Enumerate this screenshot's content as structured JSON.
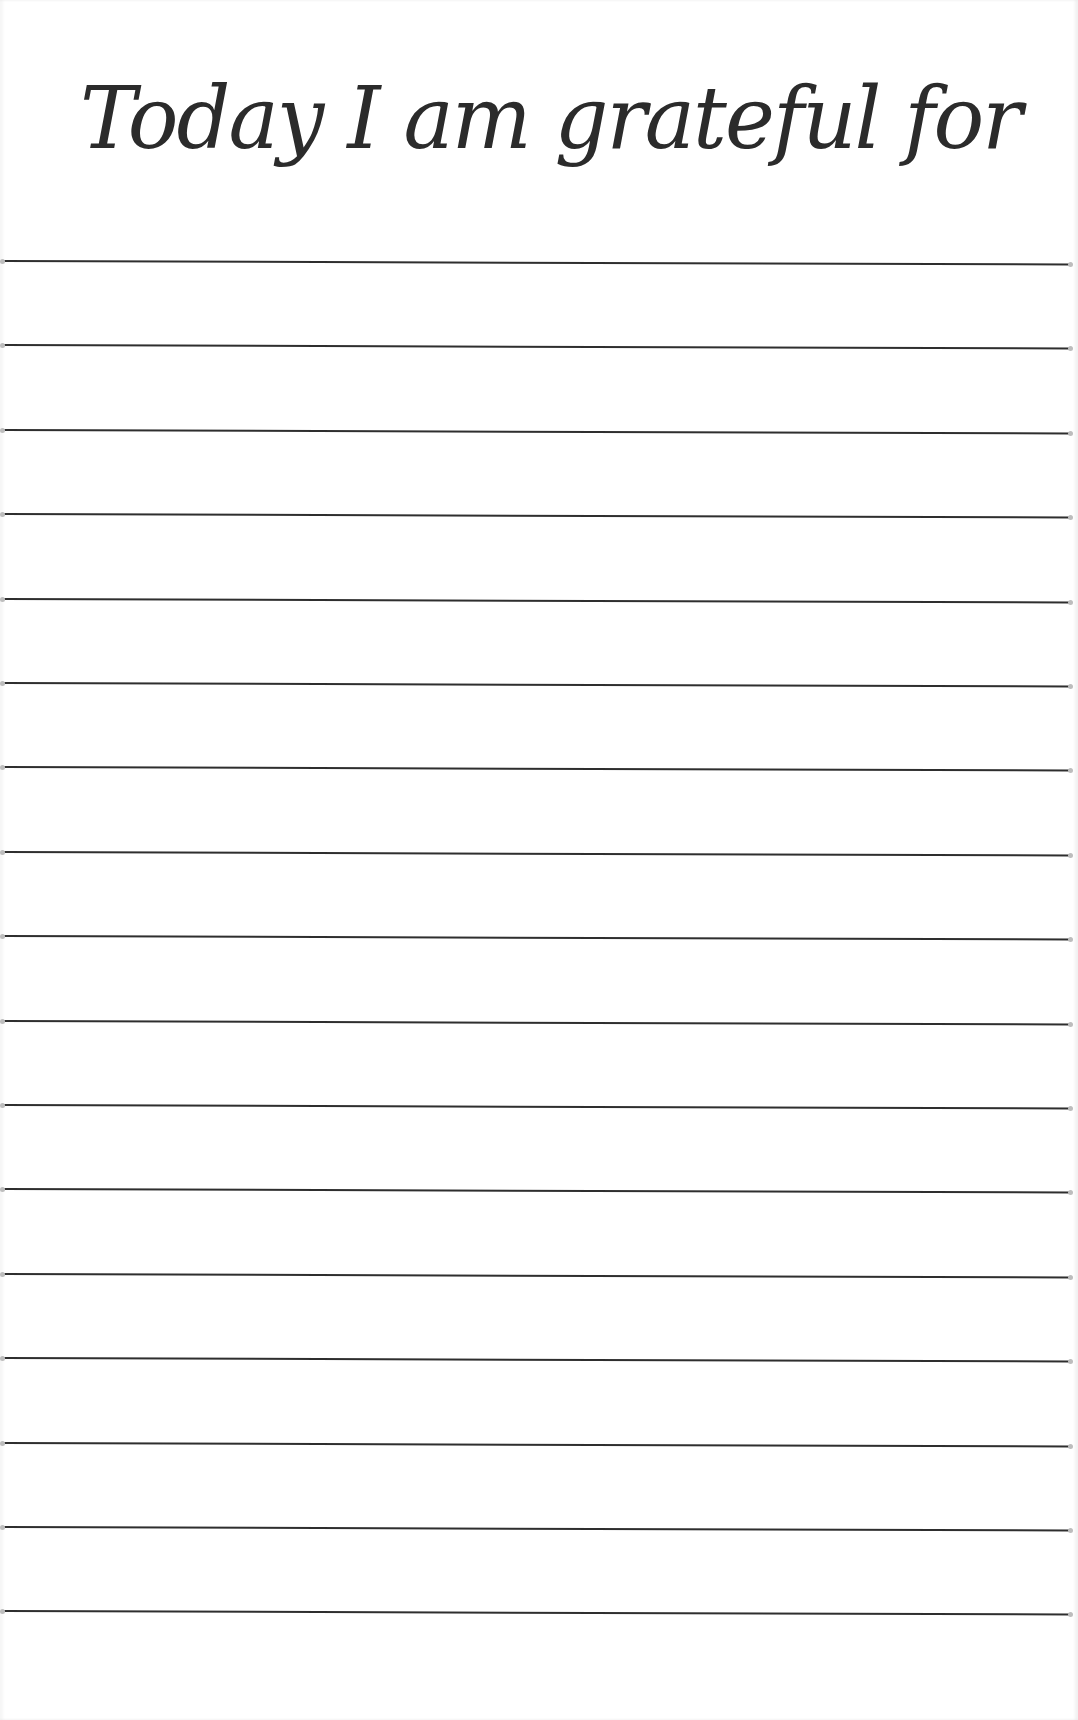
{
  "page": {
    "title": "Today I am grateful for",
    "ink_color": "#2b2b2b",
    "paper_color": "#ffffff",
    "line_count": 17,
    "first_line_y": 261,
    "line_spacing": 84.4
  },
  "lines": [
    {
      "value": ""
    },
    {
      "value": ""
    },
    {
      "value": ""
    },
    {
      "value": ""
    },
    {
      "value": ""
    },
    {
      "value": ""
    },
    {
      "value": ""
    },
    {
      "value": ""
    },
    {
      "value": ""
    },
    {
      "value": ""
    },
    {
      "value": ""
    },
    {
      "value": ""
    },
    {
      "value": ""
    },
    {
      "value": ""
    },
    {
      "value": ""
    },
    {
      "value": ""
    },
    {
      "value": ""
    }
  ]
}
